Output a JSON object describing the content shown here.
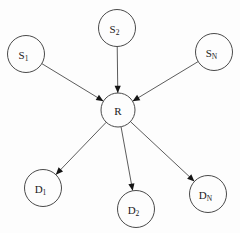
{
  "diagram": {
    "type": "directed-graph",
    "background_color": "#fdfdfd",
    "stroke_color": "#4a4a4a",
    "arrow_color": "#151515",
    "label_color": "#1a1a1a",
    "nodes": [
      {
        "id": "S1",
        "base": "S",
        "sub": "1",
        "cx": 26,
        "cy": 54,
        "r": 18.5
      },
      {
        "id": "S2",
        "base": "S",
        "sub": "2",
        "cx": 117,
        "cy": 28,
        "r": 18.5
      },
      {
        "id": "SN",
        "base": "S",
        "sub": "N",
        "cx": 214,
        "cy": 52,
        "r": 18.5
      },
      {
        "id": "R",
        "base": "R",
        "sub": "",
        "cx": 118,
        "cy": 110,
        "r": 17.0
      },
      {
        "id": "D1",
        "base": "D",
        "sub": "1",
        "cx": 43,
        "cy": 188,
        "r": 18.5
      },
      {
        "id": "D2",
        "base": "D",
        "sub": "2",
        "cx": 136,
        "cy": 209,
        "r": 18.5
      },
      {
        "id": "DN",
        "base": "D",
        "sub": "N",
        "cx": 208,
        "cy": 194,
        "r": 18.5
      }
    ],
    "edges": [
      {
        "from": "S1",
        "to": "R",
        "direction": "in"
      },
      {
        "from": "S2",
        "to": "R",
        "direction": "in"
      },
      {
        "from": "SN",
        "to": "R",
        "direction": "in"
      },
      {
        "from": "R",
        "to": "D1",
        "direction": "out"
      },
      {
        "from": "R",
        "to": "D2",
        "direction": "out"
      },
      {
        "from": "R",
        "to": "DN",
        "direction": "out"
      }
    ]
  }
}
